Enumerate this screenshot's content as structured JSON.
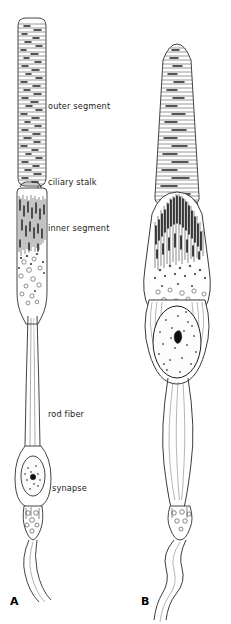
{
  "figure": {
    "background_color": "#ffffff",
    "ink_color": "#2b2b2b",
    "labels": [
      {
        "id": "outer-segment",
        "text": "outer segment",
        "x": 48,
        "y": 106
      },
      {
        "id": "ciliary-stalk",
        "text": "ciliary stalk",
        "x": 48,
        "y": 182
      },
      {
        "id": "inner-segment",
        "text": "inner segment",
        "x": 48,
        "y": 228
      },
      {
        "id": "rod-fiber",
        "text": "rod fiber",
        "x": 48,
        "y": 414
      },
      {
        "id": "synapse",
        "text": "synapse",
        "x": 52,
        "y": 488
      }
    ],
    "panels": [
      {
        "id": "panel-a",
        "letter": "A",
        "x": 10,
        "y": 598,
        "description": "rod photoreceptor cell"
      },
      {
        "id": "panel-b",
        "letter": "B",
        "x": 141,
        "y": 598,
        "description": "cone photoreceptor cell"
      }
    ],
    "structures": {
      "outer_segment": "stack of membranous discs",
      "ciliary_stalk": "connecting cilium",
      "inner_segment": "ellipsoid with mitochondria and myoid with vesicles",
      "nucleus": "oval nucleus with dark nucleolus",
      "rod_fiber": "elongated axon fiber",
      "synapse": "synaptic terminal with vesicles"
    }
  }
}
